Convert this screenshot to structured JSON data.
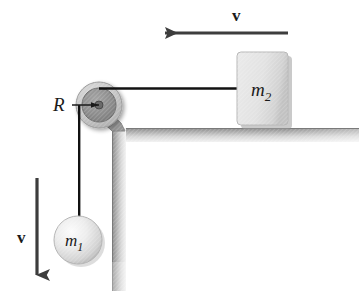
{
  "figure": {
    "background_color": "#ffffff"
  },
  "labels": {
    "radius": "R",
    "mass_hanging_base": "m",
    "mass_hanging_sub": "1",
    "mass_block_base": "m",
    "mass_block_sub": "2",
    "velocity_top": "v",
    "velocity_left": "v"
  },
  "colors": {
    "cord": "#111111",
    "arrow": "#3d3d3d",
    "table_light": "#e3e3e3",
    "table_dark": "#8f8f8f",
    "pulley_outer": "#c9c9c9",
    "pulley_inner": "#8c8c8c",
    "pulley_hub": "#5a5a5a",
    "block_fill": "#e0e0e0",
    "block_shadow": "#9a9a9a",
    "ball_fill": "#e8e8e8",
    "ball_shade": "#b5b5b5",
    "text": "#1a1a1a"
  },
  "geometry": {
    "pulley_center_x": 99,
    "pulley_center_y": 105,
    "pulley_outer_radius": 23,
    "pulley_inner_radius": 17,
    "pulley_hub_radius": 4,
    "block_x": 237,
    "block_y": 52,
    "block_width": 51,
    "block_height": 73,
    "ball_center_x": 78,
    "ball_center_y": 240,
    "ball_radius": 24,
    "table_top_y": 128,
    "table_top_height": 13,
    "table_leg_x": 112,
    "table_leg_width": 13,
    "table_leg_bottom_y": 291,
    "top_arrow_y": 33,
    "top_arrow_tail_x": 288,
    "top_arrow_head_x": 153,
    "left_arrow_x": 37,
    "left_arrow_tail_y": 178,
    "left_arrow_head_y": 289
  }
}
